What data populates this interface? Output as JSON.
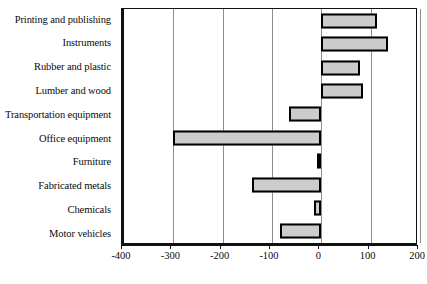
{
  "chart_data": {
    "type": "bar",
    "orientation": "horizontal",
    "title": "",
    "subtitle": "",
    "xlabel": "",
    "ylabel": "",
    "xlim": [
      -400,
      200
    ],
    "ylim": null,
    "grid": true,
    "legend": null,
    "legend_position": "none",
    "xticks": [
      -400,
      -300,
      -200,
      -100,
      0,
      100,
      200
    ],
    "xtick_labels": [
      "-400",
      "-300",
      "-200",
      "-100",
      "0",
      "100",
      "200"
    ],
    "categories": [
      "Printing and publishing",
      "Instruments",
      "Rubber and plastic",
      "Lumber and wood",
      "Transportation equipment",
      "Office equipment",
      "Furniture",
      "Fabricated metals",
      "Chemicals",
      "Motor vehicles"
    ],
    "values": [
      112,
      136,
      79,
      85,
      -65,
      -300,
      -8,
      -140,
      -15,
      -84
    ],
    "bar_fill_color": "#cccccc",
    "bar_border_color": "#000000",
    "gridline_color": "#8d8d8d",
    "axis_color": "#111111"
  }
}
